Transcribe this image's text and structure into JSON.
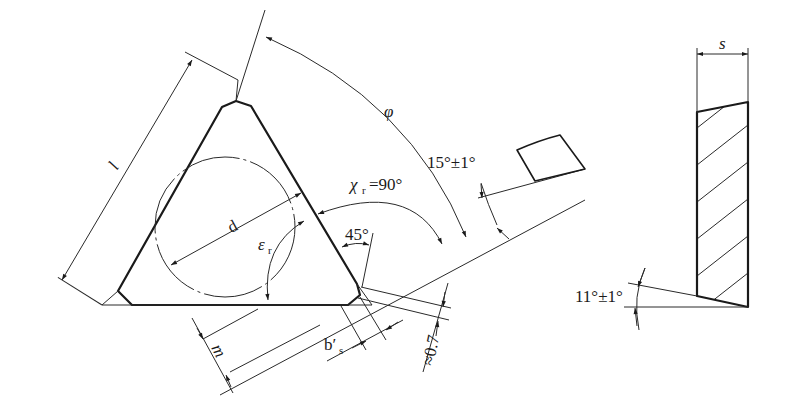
{
  "diagram": {
    "views": [
      {
        "name": "plan-view",
        "description": "Triangular insert with chamfered corners, inscribed circle and dimension annotations"
      },
      {
        "name": "section-view",
        "description": "Hatched cross-section of insert showing thickness and clearance angle"
      }
    ],
    "labels": {
      "edge_length": "l",
      "inscribed_diameter": "d",
      "included_angle_symbol": "ε",
      "included_angle_sub": "r",
      "approach_angle_symbol": "χ",
      "approach_angle_sub": "r",
      "approach_angle_value": "=90°",
      "phi": "φ",
      "rake_angle": "15°±1°",
      "chamfer_angle": "45°",
      "m_dim": "m",
      "wiper_flat_symbol": "b′",
      "wiper_flat_sub": "s",
      "chamfer_offset": "≈0.7",
      "thickness": "s",
      "clearance_angle": "11°±1°"
    }
  }
}
